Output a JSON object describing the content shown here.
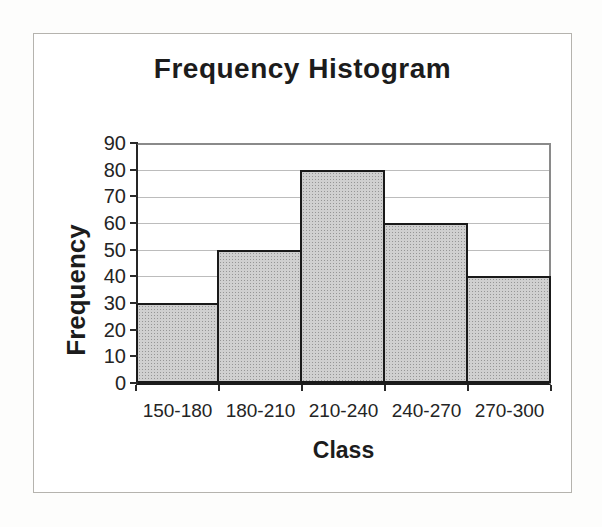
{
  "page": {
    "background_color": "#fdfdfc",
    "frame_border_color": "#b5b3ae"
  },
  "chart_data": {
    "type": "bar",
    "title": "Frequency Histogram",
    "xlabel": "Class",
    "ylabel": "Frequency",
    "categories": [
      "150-180",
      "180-210",
      "210-240",
      "240-270",
      "270-300"
    ],
    "values": [
      30,
      50,
      80,
      60,
      40
    ],
    "ylim": [
      0,
      90
    ],
    "ytick_step": 10,
    "yticks": [
      0,
      10,
      20,
      30,
      40,
      50,
      60,
      70,
      80,
      90
    ],
    "grid": true,
    "legend": false,
    "bar_fill_color": "#d0d0d0",
    "bar_dot_color": "#969696",
    "bar_border_color": "#1a1a1a",
    "gridline_color": "#bcbcbc",
    "axis_color": "#1c1c1c",
    "plot_frame_color": "#8a8a8a",
    "text_color": "#1c1c1c"
  }
}
